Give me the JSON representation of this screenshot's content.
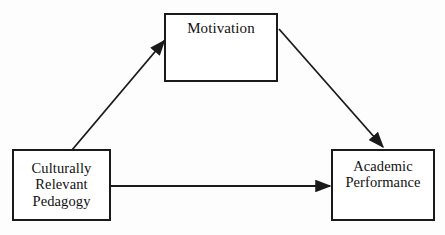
{
  "figure": {
    "type": "mediation-path-diagram",
    "background_color": "#fdfdfd",
    "line_color": "#1a1a1a",
    "text_color": "#111111",
    "width": 445,
    "height": 235
  },
  "nodes": {
    "motivation": {
      "label": "Motivation",
      "role": "mediator",
      "x": 164,
      "y": 13,
      "width": 114,
      "height": 69
    },
    "pedagogy": {
      "label": "Culturally\nRelevant\nPedagogy",
      "role": "predictor",
      "x": 12,
      "y": 149,
      "width": 99,
      "height": 72
    },
    "academic": {
      "label": "Academic\nPerformance",
      "role": "outcome",
      "x": 331,
      "y": 149,
      "width": 104,
      "height": 72
    }
  },
  "edges": [
    {
      "id": "pedagogy-to-motivation",
      "from": "pedagogy",
      "to": "motivation",
      "label": "",
      "style": "solid-arrow",
      "path": "M 72,150 L 165,41"
    },
    {
      "id": "motivation-to-academic",
      "from": "motivation",
      "to": "academic",
      "label": "",
      "style": "solid-arrow",
      "path": "M 279,29 L 383,147"
    },
    {
      "id": "pedagogy-to-academic-direct",
      "from": "pedagogy",
      "to": "academic",
      "label": "",
      "style": "solid-arrow",
      "path": "M 111,186 L 330,186"
    }
  ],
  "caption": {
    "text": ""
  }
}
